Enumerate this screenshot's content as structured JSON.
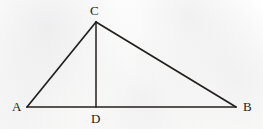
{
  "figure": {
    "name": "triangle-with-altitude",
    "caption": "",
    "background_color": "#fdfdfc",
    "stroke_color": "#231f1e",
    "label_color": "#211d1c",
    "stroke_width": 1.6,
    "canvas": {
      "width": 263,
      "height": 129
    }
  },
  "chart_data": {
    "type": "diagram",
    "title": "",
    "shape": "triangle",
    "points": [
      {
        "id": "A",
        "label": "A",
        "x": 27,
        "y": 107
      },
      {
        "id": "B",
        "label": "B",
        "x": 236,
        "y": 107
      },
      {
        "id": "C",
        "label": "C",
        "x": 96,
        "y": 22
      },
      {
        "id": "D",
        "label": "D",
        "x": 96,
        "y": 107
      }
    ],
    "segments": [
      {
        "id": "AB",
        "from": "A",
        "to": "B",
        "role": "base"
      },
      {
        "id": "AC",
        "from": "A",
        "to": "C",
        "role": "side"
      },
      {
        "id": "CB",
        "from": "C",
        "to": "B",
        "role": "side"
      },
      {
        "id": "CD",
        "from": "C",
        "to": "D",
        "role": "altitude"
      }
    ],
    "label_positions": {
      "A": {
        "x": 12,
        "y": 100,
        "anchor": "left"
      },
      "B": {
        "x": 243,
        "y": 100,
        "anchor": "left"
      },
      "C": {
        "x": 90,
        "y": 4,
        "anchor": "left"
      },
      "D": {
        "x": 91,
        "y": 112,
        "anchor": "left"
      }
    }
  },
  "labels": {
    "a": "A",
    "b": "B",
    "c": "C",
    "d": "D"
  }
}
